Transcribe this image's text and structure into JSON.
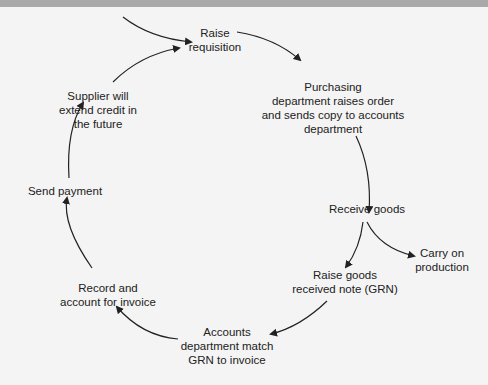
{
  "diagram": {
    "title": "",
    "type": "purchasing-cycle",
    "colors": {
      "background": "#f4f4f4",
      "topbar": "#a9a9a9",
      "text": "#222222",
      "arrow": "#222222"
    },
    "nodes": [
      {
        "id": "raise-requisition",
        "lines": [
          "Raise",
          "requisition"
        ]
      },
      {
        "id": "purchasing-raises-order",
        "lines": [
          "Purchasing",
          "department raises order",
          "and sends copy to accounts",
          "department"
        ]
      },
      {
        "id": "receive-goods",
        "lines": [
          "Receive goods"
        ]
      },
      {
        "id": "carry-on-production",
        "lines": [
          "Carry on",
          "production"
        ]
      },
      {
        "id": "raise-grn",
        "lines": [
          "Raise goods",
          "received note (GRN)"
        ]
      },
      {
        "id": "match-grn",
        "lines": [
          "Accounts",
          "department match",
          "GRN to invoice"
        ]
      },
      {
        "id": "record-invoice",
        "lines": [
          "Record and",
          "account for invoice"
        ]
      },
      {
        "id": "send-payment",
        "lines": [
          "Send payment"
        ]
      },
      {
        "id": "supplier-credit",
        "lines": [
          "Supplier will",
          "extend credit in",
          "the future"
        ]
      }
    ],
    "edges": [
      {
        "from": "external",
        "to": "raise-requisition"
      },
      {
        "from": "raise-requisition",
        "to": "purchasing-raises-order"
      },
      {
        "from": "purchasing-raises-order",
        "to": "receive-goods"
      },
      {
        "from": "receive-goods",
        "to": "carry-on-production"
      },
      {
        "from": "receive-goods",
        "to": "raise-grn"
      },
      {
        "from": "raise-grn",
        "to": "match-grn"
      },
      {
        "from": "match-grn",
        "to": "record-invoice"
      },
      {
        "from": "record-invoice",
        "to": "send-payment"
      },
      {
        "from": "send-payment",
        "to": "supplier-credit"
      },
      {
        "from": "supplier-credit",
        "to": "raise-requisition"
      }
    ]
  }
}
